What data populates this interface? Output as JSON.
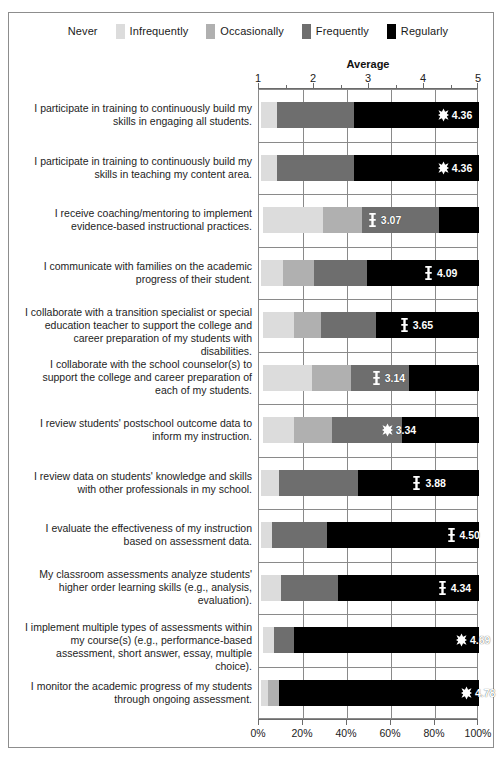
{
  "legend": {
    "items": [
      {
        "label": "Never",
        "color": "#ffffff"
      },
      {
        "label": "Infrequently",
        "color": "#dcdcdc"
      },
      {
        "label": "Occasionally",
        "color": "#b0b0b0"
      },
      {
        "label": "Frequently",
        "color": "#6e6e6e"
      },
      {
        "label": "Regularly",
        "color": "#000000"
      }
    ]
  },
  "top_axis": {
    "title": "Average",
    "tick_labels": [
      "1",
      "2",
      "3",
      "4",
      "5"
    ]
  },
  "bottom_axis": {
    "tick_labels": [
      "0%",
      "20%",
      "40%",
      "60%",
      "80%",
      "100%"
    ]
  },
  "chart_data": {
    "type": "bar",
    "title": "Average",
    "subtitle": "",
    "orientation": "horizontal",
    "stacked": true,
    "normalized_percent": true,
    "xlabel": "",
    "ylabel": "",
    "xlim": [
      0,
      100
    ],
    "secondary_axis": {
      "label": "Average",
      "range": [
        1,
        5
      ],
      "ticks": [
        1,
        2,
        3,
        4,
        5
      ]
    },
    "grid": "vertical-and-row-separators",
    "legend_position": "top-center",
    "series": [
      {
        "name": "Never",
        "color": "#ffffff",
        "values": [
          1,
          1,
          2,
          1,
          2,
          2,
          2,
          1,
          1,
          1,
          2,
          1
        ]
      },
      {
        "name": "Infrequently",
        "color": "#dcdcdc",
        "values": [
          7,
          7,
          27,
          10,
          14,
          22,
          14,
          8,
          5,
          9,
          5,
          3
        ]
      },
      {
        "name": "Occasionally",
        "color": "#b0b0b0",
        "values": [
          0,
          0,
          18,
          14,
          12,
          18,
          17,
          0,
          0,
          0,
          0,
          5
        ]
      },
      {
        "name": "Frequently",
        "color": "#6e6e6e",
        "values": [
          35,
          35,
          35,
          24,
          25,
          26,
          32,
          36,
          25,
          26,
          9,
          0
        ]
      },
      {
        "name": "Regularly",
        "color": "#000000",
        "values": [
          57,
          57,
          18,
          51,
          47,
          32,
          35,
          55,
          69,
          64,
          84,
          91
        ]
      }
    ],
    "categories": [
      "I participate in training to continuously build my skills in engaging all students.",
      "I participate in training to continuously build my skills in teaching my content area.",
      "I receive coaching/mentoring to implement evidence-based instructional practices.",
      "I communicate with families on the academic progress of their student.",
      "I collaborate with a transition specialist or special education teacher to support the college and career preparation of my students with disabilities.",
      "I collaborate with the school counselor(s) to support the college and career preparation of each of my students.",
      "I review students' postschool outcome data to inform my instruction.",
      "I review data on students' knowledge and skills with other professionals in my school.",
      "I evaluate the effectiveness of my instruction based on assessment data.",
      "My classroom assessments analyze students' higher order learning skills (e.g., analysis, evaluation).",
      "I implement multiple types of assessments within my course(s) (e.g., performance-based assessment, short answer, essay, multiple choice).",
      "I monitor the academic progress of my students through ongoing assessment."
    ],
    "averages": [
      4.36,
      4.36,
      3.07,
      4.09,
      3.65,
      3.14,
      3.34,
      3.88,
      4.5,
      4.34,
      4.69,
      4.78
    ],
    "average_marker_shapes": [
      "star",
      "star",
      "ibeam",
      "ibeam",
      "ibeam",
      "ibeam",
      "star",
      "ibeam",
      "ibeam",
      "ibeam",
      "star",
      "star"
    ]
  },
  "rows": [
    {
      "label_lines": [
        "I participate in training to continuously build my",
        "skills in engaging all students."
      ],
      "average": "4.36",
      "marker": "star",
      "segments": [
        1,
        7,
        0,
        35,
        57
      ]
    },
    {
      "label_lines": [
        "I participate in training to continuously build my",
        "skills in teaching my content area."
      ],
      "average": "4.36",
      "marker": "star",
      "segments": [
        1,
        7,
        0,
        35,
        57
      ]
    },
    {
      "label_lines": [
        "I receive coaching/mentoring to implement",
        "evidence-based instructional practices."
      ],
      "average": "3.07",
      "marker": "ibeam",
      "segments": [
        2,
        27,
        18,
        35,
        18
      ]
    },
    {
      "label_lines": [
        "I communicate with families on the academic",
        "progress of their student."
      ],
      "average": "4.09",
      "marker": "ibeam",
      "segments": [
        1,
        10,
        14,
        24,
        51
      ]
    },
    {
      "label_lines": [
        "I collaborate with a transition specialist or special",
        "education teacher to support the college and",
        "career preparation of my students with disabilities."
      ],
      "average": "3.65",
      "marker": "ibeam",
      "segments": [
        2,
        14,
        12,
        25,
        47
      ]
    },
    {
      "label_lines": [
        "I collaborate with the school counselor(s) to",
        "support the college and career preparation of",
        "each of my students."
      ],
      "average": "3.14",
      "marker": "ibeam",
      "segments": [
        2,
        22,
        18,
        26,
        32
      ]
    },
    {
      "label_lines": [
        "I review students' postschool outcome data to",
        "inform my instruction."
      ],
      "average": "3.34",
      "marker": "star",
      "segments": [
        2,
        14,
        17,
        32,
        35
      ]
    },
    {
      "label_lines": [
        "I review data on students' knowledge and skills",
        "with other professionals in my school."
      ],
      "average": "3.88",
      "marker": "ibeam",
      "segments": [
        1,
        8,
        0,
        36,
        55
      ]
    },
    {
      "label_lines": [
        "I evaluate the effectiveness of my instruction",
        "based on assessment data."
      ],
      "average": "4.50",
      "marker": "ibeam",
      "segments": [
        1,
        5,
        0,
        25,
        69
      ]
    },
    {
      "label_lines": [
        "My classroom assessments analyze students'",
        "higher order learning skills (e.g., analysis,",
        "evaluation)."
      ],
      "average": "4.34",
      "marker": "ibeam",
      "segments": [
        1,
        9,
        0,
        26,
        64
      ]
    },
    {
      "label_lines": [
        "I implement multiple types of assessments within",
        "my course(s) (e.g., performance-based",
        "assessment, short answer, essay, multiple choice)."
      ],
      "average": "4.69",
      "marker": "star",
      "segments": [
        2,
        5,
        0,
        9,
        84
      ]
    },
    {
      "label_lines": [
        "I monitor the academic progress of my students",
        "through ongoing assessment."
      ],
      "average": "4.78",
      "marker": "star",
      "segments": [
        1,
        3,
        5,
        0,
        91
      ]
    }
  ]
}
